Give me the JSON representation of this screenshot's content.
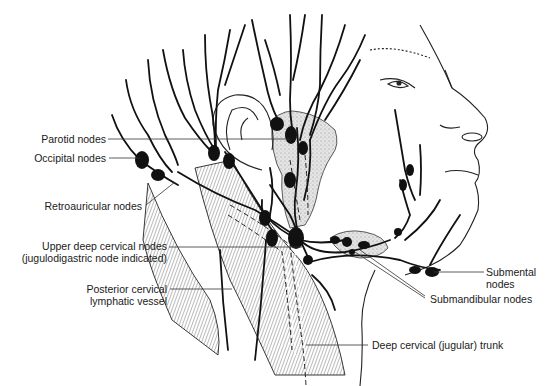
{
  "diagram": {
    "colors": {
      "ink": "#111111",
      "leader": "#333333",
      "stipple": "#dcdcdc",
      "hatch": "#555555"
    },
    "labels": {
      "parotid": "Parotid nodes",
      "occipital": "Occipital nodes",
      "retroauricular": "Retroauricular nodes",
      "upper_deep_1": "Upper deep cervical nodes",
      "upper_deep_2": "(jugulodigastric node indicated)",
      "posterior_1": "Posterior cervical",
      "posterior_2": "lymphatic vessel",
      "submental_1": "Submental",
      "submental_2": "nodes",
      "submandibular": "Submandibular nodes",
      "deep_trunk": "Deep cervical (jugular) trunk"
    }
  }
}
